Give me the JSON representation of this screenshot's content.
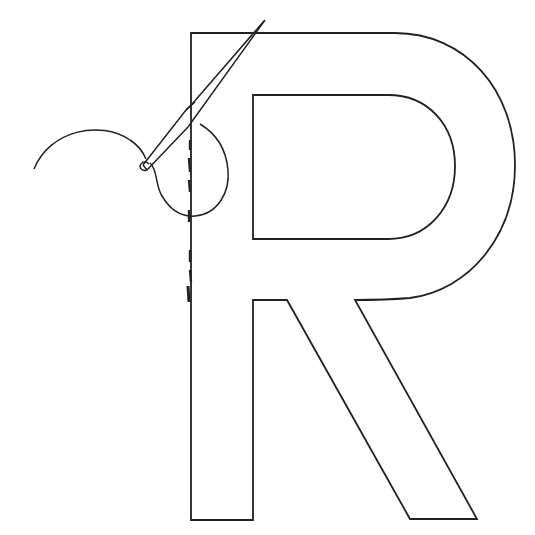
{
  "illustration": {
    "subject": "Letter R outline with sewing needle and thread",
    "letter": "R",
    "stroke_color": "#222222",
    "background_color": "#ffffff"
  }
}
